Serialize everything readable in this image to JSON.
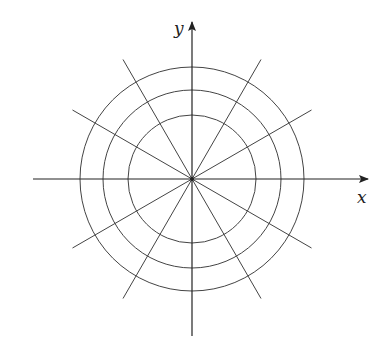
{
  "diagram": {
    "type": "polar-grid",
    "center": [
      192,
      179
    ],
    "circle_radii": [
      64,
      89,
      112
    ],
    "ray_angles_deg": [
      30,
      60,
      120,
      150,
      210,
      240,
      300,
      330
    ],
    "ray_length": 138,
    "axes": {
      "x": {
        "label": "x",
        "from": 33,
        "to": 368
      },
      "y": {
        "label": "y",
        "from": 336,
        "to": 22
      }
    },
    "stroke_color": "#444444"
  }
}
